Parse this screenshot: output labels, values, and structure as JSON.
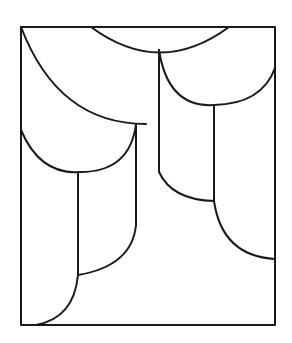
{
  "figure": {
    "colors": {
      "background": "#ffffff",
      "stroke": "#1a1a1a"
    },
    "frame": {
      "x": 21,
      "y": 27,
      "width": 254,
      "height": 298
    },
    "paths": [
      {
        "name": "top-arc",
        "d": "M 91 27 Q 160 78 229 27"
      },
      {
        "name": "large-left-arc",
        "d": "M 21 27 Q 58 124 146 124"
      },
      {
        "name": "left-middle-arc",
        "d": "M 21 130 Q 40 175 80 172 Q 130 172 136 124"
      },
      {
        "name": "right-upper-arc",
        "d": "M 159 50 Q 168 108 214 105 Q 262 104 275 68"
      },
      {
        "name": "left-vertical",
        "d": "M 136 124 L 136 225"
      },
      {
        "name": "middle-left-vertical",
        "d": "M 78 172 L 78 275"
      },
      {
        "name": "lower-left-arc-1",
        "d": "M 78 275 Q 132 266 136 225"
      },
      {
        "name": "lower-left-arc-2",
        "d": "M 78 275 Q 74 318 36 325"
      },
      {
        "name": "center-vertical",
        "d": "M 159 50 L 159 172"
      },
      {
        "name": "right-vertical",
        "d": "M 214 105 L 214 201"
      },
      {
        "name": "center-lower-arc",
        "d": "M 159 172 Q 172 200 214 201"
      },
      {
        "name": "right-lower-arc",
        "d": "M 214 201 Q 222 256 275 259"
      }
    ]
  }
}
